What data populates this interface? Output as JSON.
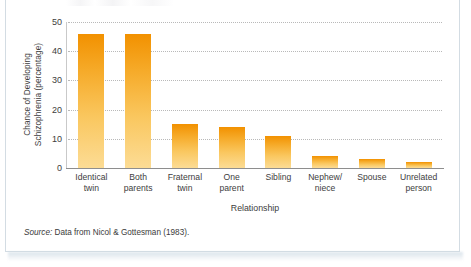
{
  "chart_data": {
    "type": "bar",
    "title": "",
    "xlabel": "Relationship",
    "ylabel": "Chance of Developing Schizophrenia (percentage)",
    "ylabel_line1": "Chance of Developing",
    "ylabel_line2": "Schizophrenia (percentage)",
    "categories": [
      "Identical twin",
      "Both parents",
      "Fraternal twin",
      "One parent",
      "Sibling",
      "Nephew/ niece",
      "Spouse",
      "Unrelated person"
    ],
    "category_lines": [
      [
        "Identical",
        "twin"
      ],
      [
        "Both",
        "parents"
      ],
      [
        "Fraternal",
        "twin"
      ],
      [
        "One",
        "parent"
      ],
      [
        "Sibling",
        ""
      ],
      [
        "Nephew/",
        "niece"
      ],
      [
        "Spouse",
        ""
      ],
      [
        "Unrelated",
        "person"
      ]
    ],
    "values": [
      46,
      46,
      15,
      14,
      11,
      4,
      3,
      2
    ],
    "ylim": [
      0,
      50
    ],
    "yticks": [
      0,
      10,
      20,
      30,
      40,
      50
    ],
    "ytick_labels": [
      "0",
      "10",
      "20",
      "30",
      "40",
      "50"
    ],
    "grid": true,
    "grid_style": "dotted-horizontal",
    "legend": "none",
    "bar_color_top": "#f29100",
    "bar_color_bottom": "#fcdc95"
  },
  "source": {
    "label": "Source:",
    "text": " Data from Nicol & Gottesman (1983)."
  },
  "colors": {
    "panel_border": "#d3dce3",
    "axis": "#8e8e8e",
    "gridline": "#b9b9b9",
    "text": "#3d3d3d",
    "bar_accent": "#f29100"
  }
}
